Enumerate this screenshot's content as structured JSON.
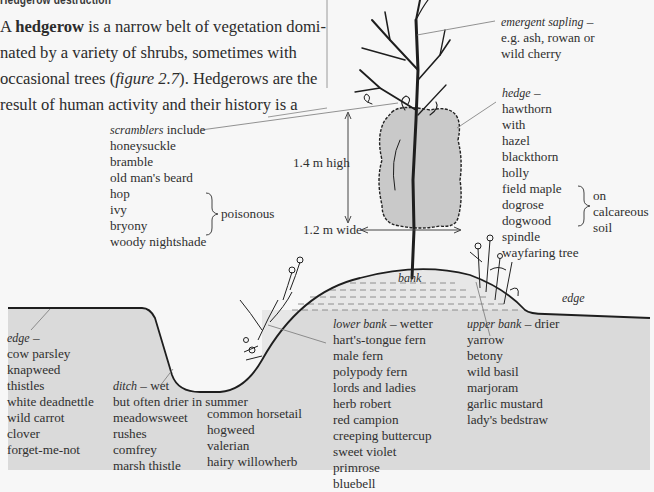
{
  "section_heading": "Hedgerow destruction",
  "paragraph": {
    "prefix": "A ",
    "term": "hedgerow",
    "line_text": " is a narrow belt of vegetation domi-nated by a variety of shrubs, sometimes with occasional trees (",
    "figure_ref": "figure 2.7",
    "suffix": "). Hedgerows are the result of human activity and their history is a"
  },
  "figure": {
    "colors": {
      "ground": "#dadada",
      "bank": "#e6e6e6",
      "hedge": "#c9c9c9",
      "ink": "#1e1e1e",
      "leader": "#777777"
    },
    "emergent_sapling": {
      "title": "emergent sapling",
      "dash": " –",
      "lines": [
        "e.g. ash, rowan or",
        "wild cherry"
      ]
    },
    "hedge": {
      "title": "hedge",
      "dash": " –",
      "items": [
        "hawthorn",
        "with",
        "hazel",
        "blackthorn",
        "holly",
        "field maple",
        "dogrose",
        "dogwood",
        "spindle",
        "wayfaring tree"
      ],
      "calcareous_note": [
        "on",
        "calcareous",
        "soil"
      ]
    },
    "scramblers": {
      "title": "scramblers",
      "suffix": " include",
      "items": [
        "honeysuckle",
        "bramble",
        "old man's beard",
        "hop",
        "ivy",
        "bryony",
        "woody nightshade"
      ],
      "poisonous_note": "poisonous"
    },
    "dimensions": {
      "height": "1.4 m high",
      "width": "1.2 m wide"
    },
    "bank_label": "bank",
    "edge_right_label": "edge",
    "edge_left": {
      "title": "edge",
      "dash": " –",
      "items": [
        "cow parsley",
        "knapweed",
        "thistles",
        "white deadnettle",
        "wild carrot",
        "clover",
        "forget-me-not"
      ]
    },
    "ditch": {
      "title": "ditch",
      "suffix": " – wet",
      "subtitle": "but often drier in summer",
      "col1": [
        "meadowsweet",
        "rushes",
        "comfrey",
        "marsh thistle"
      ],
      "col2": [
        "common horsetail",
        "hogweed",
        "valerian",
        "hairy willowherb"
      ]
    },
    "lower_bank": {
      "title": "lower bank",
      "suffix": " – wetter",
      "items": [
        "hart's-tongue fern",
        "male fern",
        "polypody fern",
        "lords and ladies",
        "herb robert",
        "red campion",
        "creeping buttercup",
        "sweet violet",
        "primrose",
        "bluebell"
      ]
    },
    "upper_bank": {
      "title": "upper bank",
      "suffix": " – drier",
      "items": [
        "yarrow",
        "betony",
        "wild basil",
        "marjoram",
        "garlic mustard",
        "lady's bedstraw"
      ]
    }
  }
}
